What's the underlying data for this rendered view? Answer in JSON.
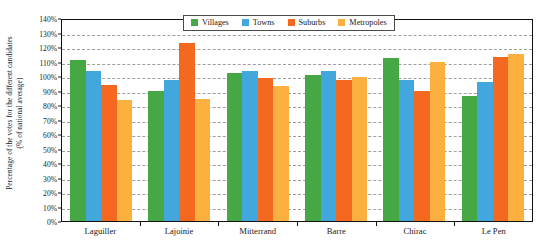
{
  "chart_data": {
    "type": "bar",
    "title": "",
    "xlabel": "",
    "ylabel": "Percentage of the votes for the different candidates (% of national average)",
    "ylabel_line1": "Percentage of the votes for the different candidates",
    "ylabel_line2": "(% of national average)",
    "ylim": [
      0,
      140
    ],
    "ytick_step": 10,
    "ytick_labels": [
      "0%",
      "10%",
      "20%",
      "30%",
      "40%",
      "50%",
      "60%",
      "70%",
      "80%",
      "90%",
      "100%",
      "110%",
      "120%",
      "130%",
      "140%"
    ],
    "ytick_values": [
      0,
      10,
      20,
      30,
      40,
      50,
      60,
      70,
      80,
      90,
      100,
      110,
      120,
      130,
      140
    ],
    "grid": true,
    "grid_axis": "y",
    "legend_position": "top-center",
    "categories": [
      "Laguiller",
      "Lajoinie",
      "Mitterrand",
      "Barre",
      "Chirac",
      "Le Pen"
    ],
    "series": [
      {
        "name": "Villages",
        "color": "#46a845",
        "values": [
          111.0,
          89.5,
          102.0,
          101.0,
          112.5,
          86.0
        ]
      },
      {
        "name": "Towns",
        "color": "#42a7dc",
        "values": [
          103.5,
          97.5,
          103.5,
          103.5,
          97.0,
          96.0
        ]
      },
      {
        "name": "Suburbs",
        "color": "#f4681f",
        "values": [
          94.0,
          122.5,
          98.5,
          97.0,
          89.5,
          113.0
        ]
      },
      {
        "name": "Metropoles",
        "color": "#fbb040",
        "values": [
          83.5,
          84.0,
          93.0,
          99.0,
          110.0,
          115.0
        ]
      }
    ]
  },
  "legend": {
    "items": [
      {
        "label": "Villages",
        "color": "#46a845"
      },
      {
        "label": "Towns",
        "color": "#42a7dc"
      },
      {
        "label": "Suburbs",
        "color": "#f4681f"
      },
      {
        "label": "Metropoles",
        "color": "#fbb040"
      }
    ]
  }
}
